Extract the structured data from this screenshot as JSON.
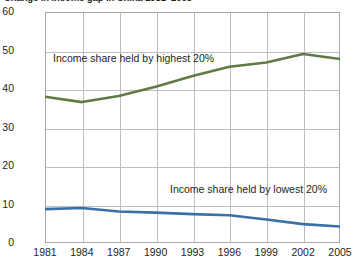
{
  "chart_data": {
    "type": "line",
    "title": "Change in income gap in China 1981–2005",
    "xlabel": "",
    "ylabel": "",
    "x": [
      1981,
      1984,
      1987,
      1990,
      1993,
      1996,
      1999,
      2002,
      2005
    ],
    "xtick_labels": [
      "1981",
      "1984",
      "1987",
      "1990",
      "1993",
      "1996",
      "1999",
      "2002",
      "2005"
    ],
    "ytick_labels": [
      "0",
      "10",
      "20",
      "30",
      "40",
      "50",
      "60"
    ],
    "yticks": [
      0,
      10,
      20,
      30,
      40,
      50,
      60
    ],
    "ylim": [
      0,
      60
    ],
    "xlim": [
      1981,
      2005
    ],
    "grid": true,
    "legend_position": "inline-annotation",
    "series": [
      {
        "name": "Income share held by highest 20%",
        "color": "#5f7a43",
        "values": [
          38.0,
          36.6,
          38.2,
          40.6,
          43.4,
          45.8,
          46.9,
          49.1,
          47.8
        ]
      },
      {
        "name": "Income share held by lowest 20%",
        "color": "#3a6fa8",
        "values": [
          8.8,
          9.1,
          8.2,
          7.9,
          7.5,
          7.2,
          6.1,
          4.9,
          4.3
        ]
      }
    ],
    "annotations": [
      {
        "text": "Income share held by highest 20%"
      },
      {
        "text": "Income share held by lowest 20%"
      }
    ]
  },
  "axis": {
    "y": [
      "60",
      "50",
      "40",
      "30",
      "20",
      "10",
      "0"
    ],
    "x": [
      "1981",
      "1984",
      "1987",
      "1990",
      "1993",
      "1996",
      "1999",
      "2002",
      "2005"
    ]
  },
  "labels": {
    "highest": "Income share held by highest 20%",
    "lowest": "Income share held by lowest 20%"
  },
  "colors": {
    "highest": "#5f7a43",
    "lowest": "#3a6fa8",
    "grid": "#bcbec0",
    "frame": "#a7a9ac",
    "text": "#231f20"
  }
}
